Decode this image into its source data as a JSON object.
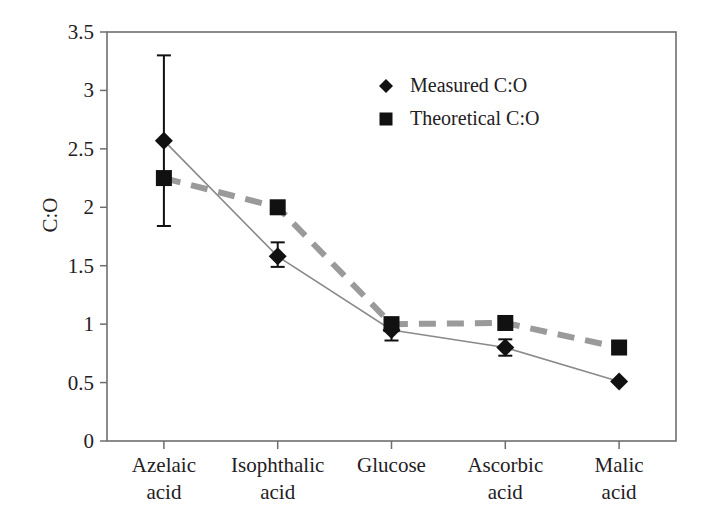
{
  "chart_data": {
    "type": "line",
    "title": "",
    "xlabel": "",
    "ylabel": "C:O",
    "ylim": [
      0,
      3.5
    ],
    "ytick_step": 0.5,
    "grid": false,
    "legend_position": "top-center-right",
    "categories": [
      "Azelaic\nacid",
      "Isophthalic\nacid",
      "Glucose",
      "Ascorbic\nacid",
      "Malic\nacid"
    ],
    "category_lines": [
      [
        "Azelaic",
        "acid"
      ],
      [
        "Isophthalic",
        "acid"
      ],
      [
        "Glucose",
        ""
      ],
      [
        "Ascorbic",
        "acid"
      ],
      [
        "Malic",
        "acid"
      ]
    ],
    "ytick_labels": [
      "0",
      "0.5",
      "1",
      "1.5",
      "2",
      "2.5",
      "3",
      "3.5"
    ],
    "ytick_values": [
      0,
      0.5,
      1,
      1.5,
      2,
      2.5,
      3,
      3.5
    ],
    "series": [
      {
        "name": "Measured C:O",
        "marker": "diamond",
        "line_style": "solid",
        "color": "#111111",
        "line_color": "#808080",
        "values": [
          2.57,
          1.58,
          0.95,
          0.8,
          0.51
        ],
        "errors_upper": [
          0.73,
          0.12,
          0.09,
          0.07,
          0.0
        ],
        "errors_lower": [
          0.73,
          0.09,
          0.09,
          0.07,
          0.0
        ]
      },
      {
        "name": "Theoretical C:O",
        "marker": "square",
        "line_style": "dashed",
        "color": "#111111",
        "line_color": "#9a9a9a",
        "values": [
          2.25,
          2.0,
          1.0,
          1.01,
          0.8
        ],
        "errors_upper": [
          0,
          0,
          0,
          0,
          0
        ],
        "errors_lower": [
          0,
          0,
          0,
          0,
          0
        ]
      }
    ],
    "colors": {
      "axis": "#6e6e6e",
      "text": "#23201e",
      "marker": "#111111",
      "measured_line": "#8a8a8a",
      "theoretical_line": "#9a9a9a",
      "background": "#ffffff"
    }
  },
  "legend": {
    "items": [
      {
        "label": "Measured C:O",
        "marker": "diamond"
      },
      {
        "label": "Theoretical C:O",
        "marker": "square"
      }
    ]
  }
}
